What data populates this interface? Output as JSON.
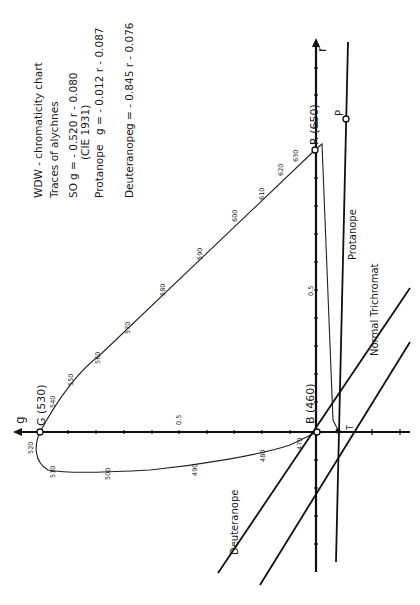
{
  "legend": {
    "title": "WDW - chromaticity chart",
    "subtitle": "Traces of alychnes",
    "so_label": "SO",
    "so_eq": "g = - 0.520 r - 0.080",
    "so_ref": "(CIE 1931)",
    "protanope_label": "Protanope",
    "protanope_eq": "g = - 0.012 r - 0.087",
    "deuteranope_label": "Deuteranope",
    "deuteranope_eq": "g = - 0.845 r - 0.076"
  },
  "axes": {
    "g_label": "g",
    "r_label": "r",
    "g_mid_tick": "0.5",
    "r_mid_tick": "0.5"
  },
  "points": {
    "G": "G (530)",
    "B": "B (460)",
    "R": "R (650)",
    "P": "P",
    "T": "T"
  },
  "lines": {
    "protanope": "Protanope",
    "normal": "Normal  Trichromat",
    "deuteranope": "Deuteranope"
  },
  "wavelengths": {
    "w470": "470",
    "w480": "480",
    "w490": "490",
    "w500": "500",
    "w510": "510",
    "w520": "520",
    "w540": "540",
    "w550": "550",
    "w560": "560",
    "w570": "570",
    "w580": "580",
    "w590": "590",
    "w600": "600",
    "w610": "610",
    "w620": "620",
    "w630": "630"
  }
}
